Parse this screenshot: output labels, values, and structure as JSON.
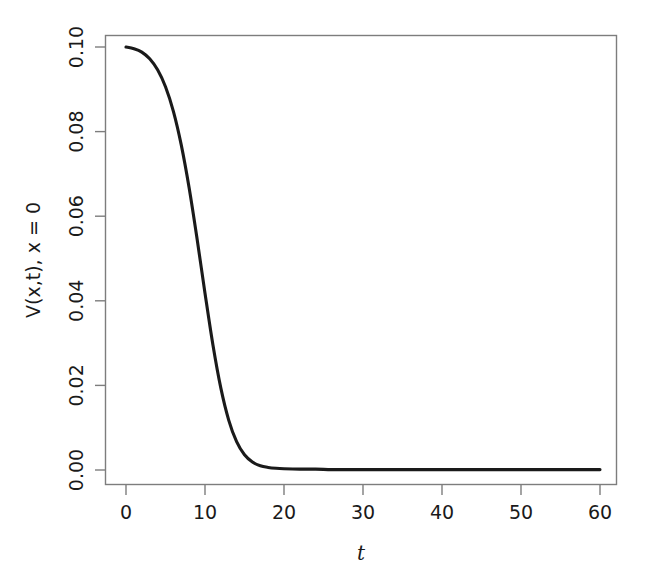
{
  "chart_data": {
    "type": "line",
    "title": "",
    "subtitle": "",
    "xlabel": "t",
    "ylabel": "V(x,t), x = 0",
    "xlim": [
      0,
      60
    ],
    "ylim": [
      0.0,
      0.1
    ],
    "grid": false,
    "legend": null,
    "xticks": [
      0,
      10,
      20,
      30,
      40,
      50,
      60
    ],
    "xtick_labels": [
      "0",
      "10",
      "20",
      "30",
      "40",
      "50",
      "60"
    ],
    "yticks": [
      0.0,
      0.02,
      0.04,
      0.06,
      0.08,
      0.1
    ],
    "ytick_labels": [
      "0.00",
      "0.02",
      "0.04",
      "0.06",
      "0.08",
      "0.10"
    ],
    "line_color": "#1a1a1a",
    "axis_color": "#7d7d7d",
    "background_color": "#ffffff",
    "series": [
      {
        "name": "V(x,t) at x = 0",
        "x": [
          0,
          1,
          2,
          3,
          4,
          5,
          6,
          7,
          8,
          9,
          10,
          11,
          12,
          13,
          14,
          15,
          16,
          17,
          18,
          19,
          20,
          22,
          24,
          26,
          28,
          30,
          35,
          40,
          45,
          50,
          55,
          60
        ],
        "y": [
          0.1,
          0.0996,
          0.0988,
          0.0972,
          0.0946,
          0.0906,
          0.0848,
          0.0768,
          0.0666,
          0.0546,
          0.0418,
          0.0296,
          0.0194,
          0.0118,
          0.0067,
          0.0036,
          0.0019,
          0.001,
          0.0006,
          0.0004,
          0.0003,
          0.0002,
          0.0002,
          0.0001,
          0.0001,
          0.0001,
          0.0001,
          0.0001,
          0.0001,
          0.0001,
          0.0001,
          0.0001
        ]
      }
    ],
    "annotations": []
  },
  "axis": {
    "y_title": "V(x,t), x = 0",
    "x_title": "t",
    "x_tick_0": "0",
    "x_tick_1": "10",
    "x_tick_2": "20",
    "x_tick_3": "30",
    "x_tick_4": "40",
    "x_tick_5": "50",
    "x_tick_6": "60",
    "y_tick_0": "0.00",
    "y_tick_1": "0.02",
    "y_tick_2": "0.04",
    "y_tick_3": "0.06",
    "y_tick_4": "0.08",
    "y_tick_5": "0.10"
  }
}
